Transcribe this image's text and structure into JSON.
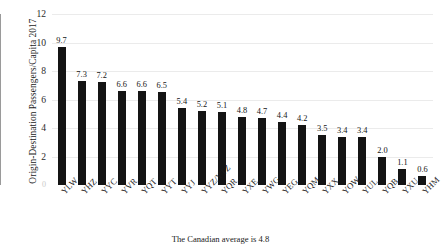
{
  "chart_data": {
    "type": "bar",
    "title": "",
    "subtitle": "",
    "xlabel": "",
    "ylabel": "Origin-Destination Passengers/Capita 2017",
    "ylim": [
      0,
      12
    ],
    "yticks": [
      0,
      2,
      4,
      6,
      8,
      10,
      12
    ],
    "ytick_labels": [
      "0",
      "2",
      "4",
      "6",
      "8",
      "10",
      "12"
    ],
    "grid": true,
    "grid_axis": "y",
    "legend": null,
    "bar_color": "#141414",
    "categories": [
      "YLW",
      "YHZ",
      "YYC",
      "YVR",
      "YQT",
      "YYT",
      "YYJ",
      "YYZ/YTZ",
      "YQR",
      "YXE",
      "YWG",
      "YEG",
      "YQM",
      "YXX",
      "YOW",
      "YUL",
      "YQB",
      "YXU",
      "YHM"
    ],
    "values": [
      9.7,
      7.3,
      7.2,
      6.6,
      6.6,
      6.5,
      5.4,
      5.2,
      5.1,
      4.8,
      4.7,
      4.4,
      4.2,
      3.5,
      3.4,
      3.4,
      2.0,
      1.1,
      0.6
    ],
    "data_labels": [
      "9.7",
      "7.3",
      "7.2",
      "6.6",
      "6.6",
      "6.5",
      "5.4",
      "5.2",
      "5.1",
      "4.8",
      "4.7",
      "4.4",
      "4.2",
      "3.5",
      "3.4",
      "3.4",
      "2.0",
      "1.1",
      "0.6"
    ],
    "annotations": [
      "The Canadian average is 4.8"
    ]
  },
  "caption": "The Canadian average is 4.8"
}
